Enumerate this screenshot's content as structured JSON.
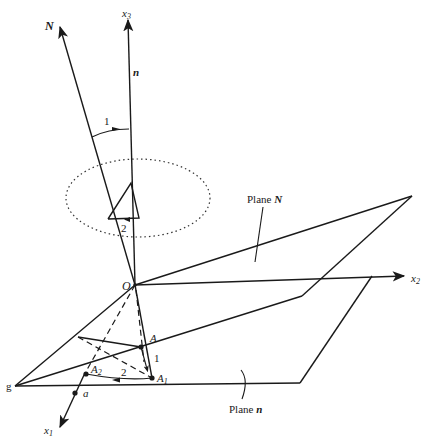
{
  "diagram": {
    "type": "3D geometric coordinate diagram",
    "colors": {
      "ink": "#1a1a1a",
      "background": "#ffffff"
    },
    "axes": {
      "x1": {
        "label": "x",
        "subscript": "1"
      },
      "x2": {
        "label": "x",
        "subscript": "2"
      },
      "x3": {
        "label": "x",
        "subscript": "3"
      },
      "N": {
        "label": "N"
      },
      "n": {
        "label": "n"
      }
    },
    "points": {
      "origin": "O",
      "A": "A",
      "A1": {
        "label": "A",
        "subscript": "1"
      },
      "A2": {
        "label": "A",
        "subscript": "2"
      },
      "a": "a",
      "g": "g"
    },
    "angles": {
      "rotation_1_top": "1",
      "rotation_2_top": "2",
      "rotation_1_bottom": "1",
      "rotation_2_bottom": "2"
    },
    "planes": {
      "plane_N": {
        "prefix": "Plane ",
        "name": "N"
      },
      "plane_n": {
        "prefix": "Plane ",
        "name": "n"
      }
    }
  }
}
